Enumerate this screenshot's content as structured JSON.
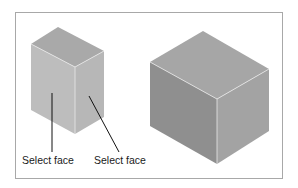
{
  "figure": {
    "labels": {
      "left_face": "Select face",
      "right_face": "Select face"
    },
    "colors": {
      "frame_border": "#a8a8a8",
      "small_box_top": "#a9a9a9",
      "small_box_left": "#bdbdbd",
      "small_box_right": "#b7b7b7",
      "large_box_top": "#a6a6a6",
      "large_box_left": "#8f8f8f",
      "large_box_right": "#a3a3a3",
      "edge_highlight": "#e8e8e8",
      "leader_line": "#111111"
    }
  }
}
